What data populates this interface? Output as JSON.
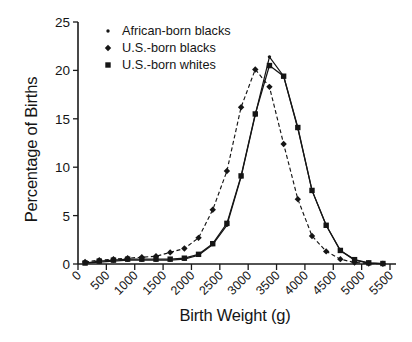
{
  "chart_data": {
    "type": "line",
    "title": "",
    "xlabel": "Birth Weight (g)",
    "ylabel": "Percentage of Births",
    "xlim": [
      0,
      5500
    ],
    "ylim": [
      0,
      25
    ],
    "xticks": [
      0,
      500,
      1000,
      1500,
      2000,
      2500,
      3000,
      3500,
      4000,
      4500,
      5000,
      5500
    ],
    "xtick_labels": [
      "0",
      "500",
      "1000",
      "1500",
      "2000",
      "2500",
      "3000",
      "3500",
      "4000",
      "4500",
      "5000",
      "5500"
    ],
    "yticks": [
      0,
      5,
      10,
      15,
      20,
      25
    ],
    "ytick_labels": [
      "0",
      "5",
      "10",
      "15",
      "20",
      "25"
    ],
    "grid": false,
    "legend_position": "top-left",
    "x": [
      125,
      375,
      625,
      875,
      1125,
      1375,
      1625,
      1875,
      2125,
      2375,
      2625,
      2875,
      3125,
      3375,
      3625,
      3875,
      4125,
      4375,
      4625,
      4875,
      5125,
      5375
    ],
    "series": [
      {
        "name": "African-born blacks",
        "marker": "dot",
        "linestyle": "solid",
        "color": "#151515",
        "values": [
          0.1,
          0.2,
          0.3,
          0.4,
          0.4,
          0.4,
          0.4,
          0.5,
          0.9,
          2.0,
          4.0,
          9.0,
          15.4,
          21.4,
          19.4,
          14.0,
          7.6,
          4.0,
          1.4,
          0.4,
          0.1,
          0.05
        ]
      },
      {
        "name": "U.S.-born blacks",
        "marker": "diamond",
        "linestyle": "dashed",
        "color": "#151515",
        "values": [
          0.2,
          0.4,
          0.5,
          0.6,
          0.7,
          0.8,
          1.2,
          1.6,
          2.7,
          5.6,
          9.6,
          16.2,
          20.1,
          18.3,
          12.4,
          6.7,
          2.9,
          1.3,
          0.5,
          0.15,
          0.05,
          0.02
        ]
      },
      {
        "name": "U.S.-born whites",
        "marker": "square",
        "linestyle": "solid",
        "color": "#151515",
        "values": [
          0.1,
          0.3,
          0.4,
          0.5,
          0.5,
          0.5,
          0.5,
          0.6,
          1.0,
          2.1,
          4.2,
          9.1,
          15.5,
          20.5,
          19.4,
          14.1,
          7.6,
          4.0,
          1.4,
          0.45,
          0.12,
          0.05
        ]
      }
    ]
  },
  "legend": {
    "items": [
      {
        "label": "African-born blacks",
        "marker": "dot"
      },
      {
        "label": "U.S.-born blacks",
        "marker": "diamond"
      },
      {
        "label": "U.S.-born whites",
        "marker": "square"
      }
    ]
  },
  "axes": {
    "ylabel": "Percentage of Births",
    "xlabel": "Birth Weight (g)"
  }
}
